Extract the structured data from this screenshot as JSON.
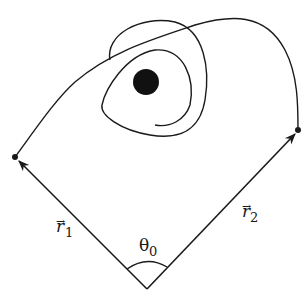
{
  "diagram": {
    "vector_1": {
      "symbol": "r",
      "subscript": "1",
      "arrow": "→"
    },
    "vector_2": {
      "symbol": "r",
      "subscript": "2",
      "arrow": "→"
    },
    "angle": {
      "symbol": "θ",
      "subscript": "0"
    },
    "central_body": "filled-circle",
    "colors": {
      "stroke": "#1a1a1a",
      "body": "#111111",
      "background": "#ffffff"
    }
  }
}
